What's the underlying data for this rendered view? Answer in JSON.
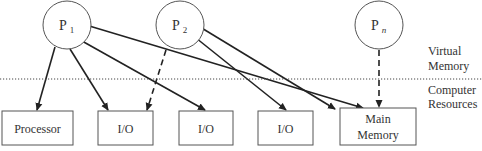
{
  "processes": [
    {
      "id": "p1",
      "label": "P",
      "sub": "1",
      "cx": 67,
      "cy": 25
    },
    {
      "id": "p2",
      "label": "P",
      "sub": "2",
      "cx": 180,
      "cy": 25
    },
    {
      "id": "pn",
      "label": "P",
      "sub": "n",
      "cx": 379,
      "cy": 25
    }
  ],
  "layers": {
    "virtual": [
      "Virtual",
      "Memory"
    ],
    "resources": [
      "Computer",
      "Resources"
    ]
  },
  "resources": [
    {
      "id": "processor",
      "lines": [
        "Processor"
      ]
    },
    {
      "id": "io1",
      "lines": [
        "I/O"
      ]
    },
    {
      "id": "io2",
      "lines": [
        "I/O"
      ]
    },
    {
      "id": "io3",
      "lines": [
        "I/O"
      ]
    },
    {
      "id": "main-memory",
      "lines": [
        "Main",
        "Memory"
      ]
    }
  ],
  "edges": [
    {
      "from": "p1",
      "to": "processor",
      "style": "solid"
    },
    {
      "from": "p1",
      "to": "io1",
      "style": "solid"
    },
    {
      "from": "p1",
      "to": "io2",
      "style": "solid"
    },
    {
      "from": "p1",
      "to": "main-memory",
      "style": "solid"
    },
    {
      "from": "p2",
      "to": "io1",
      "style": "dashed"
    },
    {
      "from": "p2",
      "to": "io3",
      "style": "solid"
    },
    {
      "from": "p2",
      "to": "main-memory",
      "style": "solid"
    },
    {
      "from": "pn",
      "to": "main-memory",
      "style": "dashed"
    }
  ]
}
